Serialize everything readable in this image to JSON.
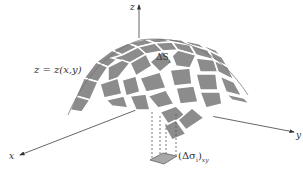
{
  "diagram": {
    "type": "surface-area-element",
    "axes": {
      "z": {
        "label": "z"
      },
      "x": {
        "label": "x"
      },
      "y": {
        "label": "y"
      }
    },
    "surface_label": "z = z(x,y)",
    "surface_patch_label": "ΔS",
    "surface_patch_sub": "i",
    "projection_label": "(Δσ",
    "projection_label_sub_i": "i",
    "projection_label_close": ")",
    "projection_label_sub_xy": "xy",
    "colors": {
      "patch_fill": "#8c8c8c",
      "patch_gap": "#ffffff",
      "surface_edge": "#6e6e6e",
      "axis": "#444444",
      "text": "#333333",
      "projection_fill": "#a8a8a8"
    }
  }
}
